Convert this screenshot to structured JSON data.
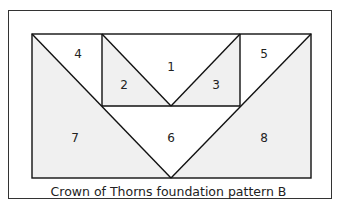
{
  "diagram": {
    "caption": "Crown of Thorns foundation pattern B",
    "pieces": [
      {
        "label": "1",
        "x": 171,
        "y": 67
      },
      {
        "label": "2",
        "x": 124,
        "y": 85
      },
      {
        "label": "3",
        "x": 216,
        "y": 85
      },
      {
        "label": "4",
        "x": 78,
        "y": 54
      },
      {
        "label": "5",
        "x": 264,
        "y": 54
      },
      {
        "label": "6",
        "x": 171,
        "y": 138
      },
      {
        "label": "7",
        "x": 75,
        "y": 138
      },
      {
        "label": "8",
        "x": 264,
        "y": 138
      }
    ],
    "colors": {
      "shaded": "#f0f0f0",
      "white": "#ffffff",
      "line": "#111111"
    }
  }
}
